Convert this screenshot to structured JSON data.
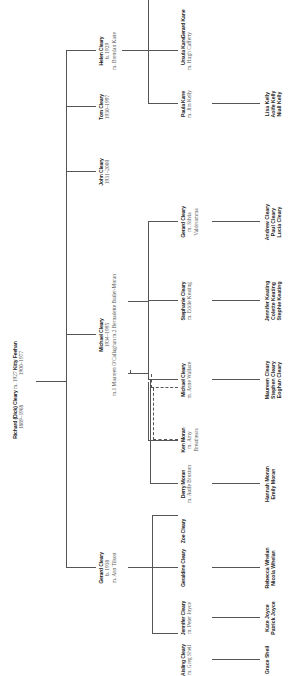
{
  "root": {
    "name": "Richard (Dick) Cleary",
    "marriage": "m. 1927",
    "spouse": "Kitty Feehan",
    "dates": "1889–1968",
    "spouse_dates": "1900–1977"
  },
  "children": [
    {
      "name": "Helen Cleary",
      "line2": "b. 1929",
      "line3": "m. Brendan Kane"
    },
    {
      "name": "Tom Cleary",
      "line2": "1930–1997",
      "line3": ""
    },
    {
      "name": "John Cleary",
      "line2": "1931–2000",
      "line3": ""
    },
    {
      "name": "Michael Cleary",
      "line2": "1934–1995",
      "line3": "m.1 Maureen O'Callaghan  m.2 Bernadette Butler-Moran"
    },
    {
      "name": "Gerard Cleary",
      "line2": "b. 1938",
      "line3": "m. Ann Tilson"
    }
  ],
  "grandchildren": [
    {
      "name": "Gerard Kane",
      "line2": "",
      "line3": ""
    },
    {
      "name": "Ursula Kane",
      "line2": "m. Hugh Cafferty",
      "line3": ""
    },
    {
      "name": "Paula Kane",
      "line2": "m. Jim Kelly",
      "line3": ""
    },
    {
      "name": "Gerard Cleary",
      "line2": "m. Silvia",
      "line3": "Valderamma"
    },
    {
      "name": "Stephanie Cleary",
      "line2": "m. Eddie Keating",
      "line3": ""
    },
    {
      "name": "Michael Cleary",
      "line2": "m. Anne Wallace",
      "line3": ""
    },
    {
      "name": "Ken Moran",
      "line2": "m. Amy",
      "line3": "Breathears"
    },
    {
      "name": "Derry Moran",
      "line2": "m. Aoife Broxton",
      "line3": ""
    },
    {
      "name": "Zoe Cleary",
      "line2": "",
      "line3": ""
    },
    {
      "name": "Geraldine Cleary",
      "line2": "",
      "line3": ""
    },
    {
      "name": "Jennifer Cleary",
      "line2": "m. Peter Joyce",
      "line3": ""
    },
    {
      "name": "Aisling Cleary",
      "line2": "m. Greg Sheil",
      "line3": ""
    }
  ],
  "great_grandchildren": [
    {
      "lines": [
        "Lisa Kelly",
        "Aoife Kelly",
        "Niall Kelly"
      ]
    },
    {
      "lines": [
        "Andrew Cleary",
        "Paul Cleary",
        "Lucia Cleary"
      ]
    },
    {
      "lines": [
        "Jennifer Keating",
        "Colette Keating",
        "Stephie Keating"
      ]
    },
    {
      "lines": [
        "Maureen Cleary",
        "Stephen Cleary",
        "Eoghan Cleary"
      ]
    },
    {
      "lines": [
        "Hannah Moran",
        "Emily Moran"
      ]
    },
    {
      "lines": [
        "Rebecca Whelan",
        "Nicola Whelan"
      ]
    },
    {
      "lines": [
        "Kate Joyce",
        "Patrick Joyce"
      ]
    },
    {
      "lines": [
        "Grace Sheil"
      ]
    }
  ]
}
